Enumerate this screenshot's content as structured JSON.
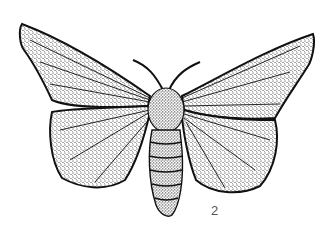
{
  "figure": {
    "label": "2",
    "colors": {
      "background": "#ffffff",
      "ink": "#111111",
      "label": "#555555"
    }
  }
}
